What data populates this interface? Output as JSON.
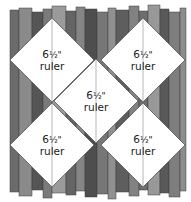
{
  "diagram": {
    "colors": {
      "background": "#ffffff",
      "diamond_fill": "#ffffff",
      "diamond_stroke": "#555555",
      "strips": [
        "#6b6b6b",
        "#8a8a8a",
        "#555555",
        "#7a7a7a",
        "#9a9a9a",
        "#646464",
        "#858585",
        "#4e4e4e",
        "#777777",
        "#909090",
        "#5e5e5e",
        "#828282",
        "#6e6e6e",
        "#989898",
        "#595959",
        "#7e7e7e",
        "#8c8c8c",
        "#626262",
        "#747474",
        "#949494"
      ]
    },
    "strips": [
      {
        "x": 10,
        "w": 9,
        "top": 10,
        "bottom": 192
      },
      {
        "x": 19,
        "w": 13,
        "top": 8,
        "bottom": 196
      },
      {
        "x": 32,
        "w": 11,
        "top": 12,
        "bottom": 190
      },
      {
        "x": 43,
        "w": 9,
        "top": 9,
        "bottom": 198
      },
      {
        "x": 52,
        "w": 14,
        "top": 6,
        "bottom": 193
      },
      {
        "x": 66,
        "w": 10,
        "top": 11,
        "bottom": 195
      },
      {
        "x": 76,
        "w": 9,
        "top": 7,
        "bottom": 191
      },
      {
        "x": 85,
        "w": 12,
        "top": 9,
        "bottom": 197
      },
      {
        "x": 97,
        "w": 11,
        "top": 12,
        "bottom": 194
      },
      {
        "x": 108,
        "w": 8,
        "top": 8,
        "bottom": 199
      },
      {
        "x": 116,
        "w": 13,
        "top": 10,
        "bottom": 192
      },
      {
        "x": 129,
        "w": 10,
        "top": 6,
        "bottom": 196
      },
      {
        "x": 139,
        "w": 9,
        "top": 11,
        "bottom": 190
      },
      {
        "x": 148,
        "w": 12,
        "top": 5,
        "bottom": 195
      },
      {
        "x": 160,
        "w": 9,
        "top": 9,
        "bottom": 193
      },
      {
        "x": 169,
        "w": 11,
        "top": 12,
        "bottom": 197
      },
      {
        "x": 180,
        "w": 6,
        "top": 8,
        "bottom": 191
      }
    ],
    "rulers": [
      {
        "id": "top-left",
        "cx": 52,
        "cy": 60,
        "r": 42,
        "label_size": "6",
        "label_frac": "½\"",
        "label_word": "ruler"
      },
      {
        "id": "top-right",
        "cx": 143,
        "cy": 60,
        "r": 42,
        "label_size": "6",
        "label_frac": "½\"",
        "label_word": "ruler"
      },
      {
        "id": "center",
        "cx": 96,
        "cy": 101,
        "r": 42,
        "label_size": "6",
        "label_frac": "½\"",
        "label_word": "ruler"
      },
      {
        "id": "bottom-left",
        "cx": 52,
        "cy": 145,
        "r": 42,
        "label_size": "6",
        "label_frac": "½\"",
        "label_word": "ruler"
      },
      {
        "id": "bottom-right",
        "cx": 143,
        "cy": 145,
        "r": 42,
        "label_size": "6",
        "label_frac": "½\"",
        "label_word": "ruler"
      }
    ]
  }
}
